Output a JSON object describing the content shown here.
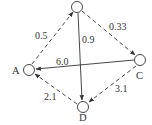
{
  "diagram": {
    "type": "directed-graph",
    "colors": {
      "stroke": "#333333",
      "background": "#ffffff"
    },
    "nodes": [
      {
        "id": "top",
        "label": "",
        "x": 77,
        "y": 7
      },
      {
        "id": "A",
        "label": "A",
        "x": 29,
        "y": 70
      },
      {
        "id": "C",
        "label": "C",
        "x": 140,
        "y": 60
      },
      {
        "id": "D",
        "label": "D",
        "x": 83,
        "y": 107
      }
    ],
    "edges": [
      {
        "from": "A",
        "to": "top",
        "weight": "0.5",
        "style": "dashed"
      },
      {
        "from": "top",
        "to": "C",
        "weight": "0.33",
        "style": "dashed"
      },
      {
        "from": "top",
        "to": "D",
        "weight": "0.9",
        "style": "solid"
      },
      {
        "from": "C",
        "to": "A",
        "weight": "6.0",
        "style": "solid"
      },
      {
        "from": "C",
        "to": "D",
        "weight": "3.1",
        "style": "dashed"
      },
      {
        "from": "D",
        "to": "A",
        "weight": "2.1",
        "style": "dashed"
      }
    ]
  }
}
